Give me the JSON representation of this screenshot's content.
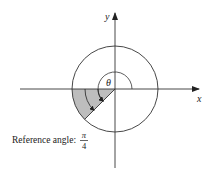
{
  "diagram": {
    "axes": {
      "x_label": "x",
      "y_label": "y"
    },
    "angle": {
      "symbol": "θ",
      "value_degrees": 225,
      "terminal_quadrant": "III"
    },
    "reference_angle": {
      "label": "Reference angle:",
      "numerator": "π",
      "denominator": "4",
      "value_degrees": 45
    },
    "colors": {
      "stroke": "#333333",
      "shade": "#bdbdbd"
    }
  }
}
